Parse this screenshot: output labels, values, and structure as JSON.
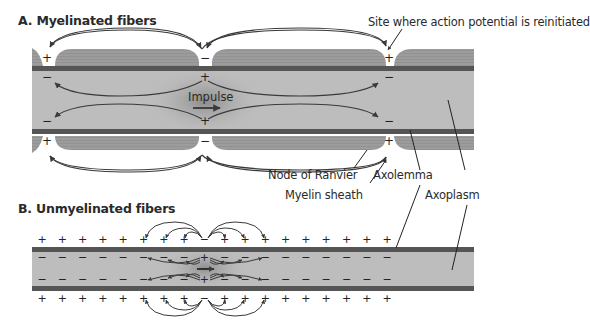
{
  "figure": {
    "panel_a": {
      "title": "A. Myelinated fibers",
      "labels": {
        "site": "Site where action potential is reinitiated",
        "impulse": "Impulse",
        "node": "Node of Ranvier",
        "myelin": "Myelin sheath",
        "axolemma": "Axolemma",
        "axoplasm": "Axoplasm"
      },
      "charges": {
        "outer_left_node": "+",
        "outer_center_node": "−",
        "outer_right_node": "+",
        "inner_left_node": "−",
        "inner_center_node": "+",
        "inner_right_node": "−"
      }
    },
    "panel_b": {
      "title": "B. Unmyelinated fibers",
      "outside_charge": "+",
      "inside_charge": "−",
      "depolarized_outside": "−",
      "depolarized_inside": "+"
    },
    "colors": {
      "axoplasm": "#bdbdbd",
      "myelin": "#9a9a9a",
      "membrane": "#555555",
      "arrow": "#3a3a3a",
      "text": "#2a2a2a"
    }
  }
}
